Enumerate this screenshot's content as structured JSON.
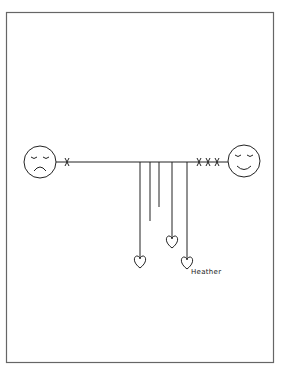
{
  "drawing": {
    "frame": {
      "x": 6,
      "y": 12,
      "width": 267,
      "height": 350,
      "color": "#555555"
    },
    "stroke_color": "#222222",
    "rope": {
      "x1": 63,
      "x2": 227,
      "y": 162
    },
    "left_face": {
      "mood": "sad",
      "cx": 40,
      "cy": 162,
      "r": 16
    },
    "right_face": {
      "mood": "happy",
      "cx": 244,
      "cy": 162,
      "r": 16
    },
    "left_marks": {
      "count": 1,
      "symbol": "x"
    },
    "right_marks": {
      "count": 3,
      "symbol": "x"
    },
    "strings": [
      {
        "x": 140,
        "end_y": 257,
        "heart": true
      },
      {
        "x": 150,
        "end_y": 221,
        "heart": false
      },
      {
        "x": 159,
        "end_y": 207,
        "heart": false
      },
      {
        "x": 172,
        "end_y": 237,
        "heart": true
      },
      {
        "x": 187,
        "end_y": 258,
        "heart": true
      }
    ],
    "label": {
      "text": "Heather"
    }
  }
}
